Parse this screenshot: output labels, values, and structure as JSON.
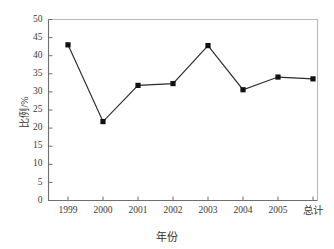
{
  "chart_data": {
    "type": "line",
    "title": "",
    "subtitle": "",
    "xlabel": "年份",
    "ylabel": "比例/%",
    "categories": [
      "1999",
      "2000",
      "2001",
      "2002",
      "2003",
      "2004",
      "2005",
      "总计"
    ],
    "values": [
      43.0,
      21.8,
      31.8,
      32.3,
      42.8,
      30.6,
      34.1,
      33.6
    ],
    "series": [
      {
        "name": "比例",
        "values": [
          43.0,
          21.8,
          31.8,
          32.3,
          42.8,
          30.6,
          34.1,
          33.6
        ]
      }
    ],
    "ylim": [
      0,
      50
    ],
    "ytick_labels": [
      "0",
      "5",
      "10",
      "15",
      "20",
      "25",
      "30",
      "35",
      "40",
      "45",
      "50"
    ],
    "ytick_values": [
      0,
      5,
      10,
      15,
      20,
      25,
      30,
      35,
      40,
      45,
      50
    ],
    "xtick_labels": [
      "1999",
      "2000",
      "2001",
      "2002",
      "2003",
      "2004",
      "2005",
      "总计"
    ],
    "grid": false,
    "legend": false,
    "legend_position": "none",
    "marker": "square",
    "marker_color": "#111111",
    "line_color": "#2b2b2b",
    "frame_color": "#b9b9b9",
    "axis_color": "#6e6e6e",
    "background_color": "#ffffff",
    "annotations": []
  }
}
